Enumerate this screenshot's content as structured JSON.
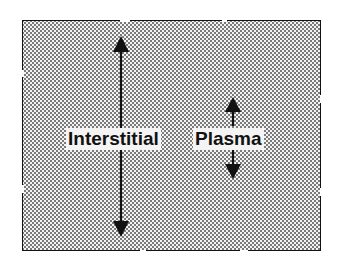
{
  "diagram": {
    "labels": {
      "interstitial": "Interstitial",
      "plasma": "Plasma"
    },
    "colors": {
      "ink": "#111111",
      "stipple": "#7a7a7a",
      "background": "#ffffff"
    },
    "arrows": [
      {
        "name": "interstitial-arrow",
        "x": 121,
        "y_top": 37,
        "y_bottom": 236,
        "direction": "both"
      },
      {
        "name": "plasma-arrow-up",
        "x": 233,
        "y_top": 97,
        "y_bottom": 125,
        "direction": "up"
      },
      {
        "name": "plasma-arrow-down",
        "x": 233,
        "y_top": 150,
        "y_bottom": 178,
        "direction": "down"
      }
    ]
  }
}
